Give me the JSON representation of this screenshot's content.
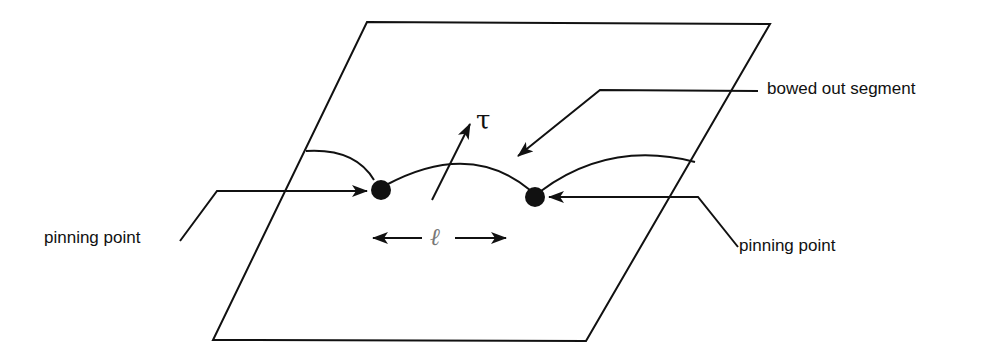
{
  "diagram": {
    "labels": {
      "bowed_out_segment": "bowed out segment",
      "pinning_point_left": "pinning point",
      "pinning_point_right": "pinning point",
      "stress_symbol": "τ",
      "length_symbol": "ℓ"
    },
    "colors": {
      "line": "#111111",
      "background": "#ffffff",
      "length_symbol": "#777777"
    }
  }
}
